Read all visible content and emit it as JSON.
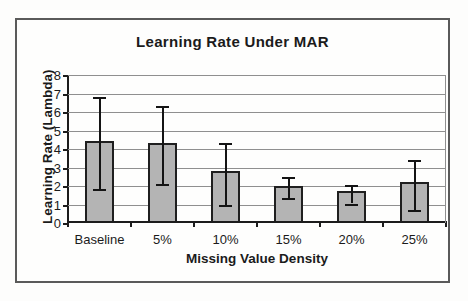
{
  "figure": {
    "title": "Learning Rate Under MAR"
  },
  "chart_data": {
    "type": "bar",
    "title": "Learning Rate Under MAR",
    "xlabel": "Missing Value Density",
    "ylabel": "Learning Rate (Lambda)",
    "categories": [
      "Baseline",
      "5%",
      "10%",
      "15%",
      "20%",
      "25%"
    ],
    "values": [
      4.3,
      4.2,
      2.7,
      1.9,
      1.6,
      2.1
    ],
    "error_low": [
      1.85,
      2.1,
      0.95,
      1.35,
      1.05,
      0.7
    ],
    "error_high": [
      6.8,
      6.3,
      4.3,
      2.5,
      2.05,
      3.4
    ],
    "ylim": [
      0,
      8
    ],
    "yticks": [
      0,
      1,
      2,
      3,
      4,
      5,
      6,
      7,
      8
    ],
    "grid": true,
    "legend": "none",
    "bar_color": "#b4b4b4",
    "bar_border_color": "#1f1f1f",
    "error_bar_color": "#141414",
    "gridline_color": "#8f8f8f",
    "axis_color": "#1c1c1c"
  }
}
